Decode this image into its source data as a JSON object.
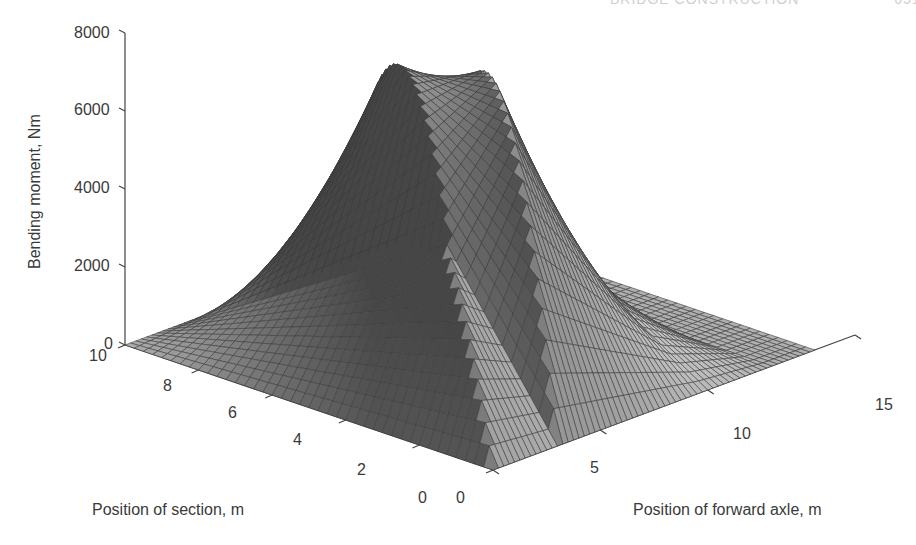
{
  "page": {
    "running_head": "BRIDGE CONSTRUCTION",
    "page_number": "651"
  },
  "chart_data": {
    "type": "surface3d",
    "title": "",
    "xlabel": "Position of forward axle, m",
    "ylabel": "Position of section, m",
    "zlabel": "Bending moment, Nm",
    "x_ticks": [
      "0",
      "5",
      "10",
      "15"
    ],
    "y_ticks": [
      "0",
      "2",
      "4",
      "6",
      "8",
      "10"
    ],
    "z_ticks": [
      "0",
      "2000",
      "4000",
      "6000",
      "8000"
    ],
    "x_range": [
      0,
      15
    ],
    "y_range": [
      0,
      10
    ],
    "z_range": [
      0,
      8000
    ],
    "grid": false,
    "colormap": "gray",
    "model": {
      "description": "Bending moment at a section of a 10 m simply supported span under a two-axle vehicle",
      "span_m": 10,
      "axle_spacing_m": 3,
      "forward_axle_load": 2000,
      "rear_axle_load": 2000
    },
    "key_points": [
      {
        "section": 5,
        "forward_axle": 6.5,
        "moment": 7000
      },
      {
        "section": 5,
        "forward_axle": 5,
        "moment": 5000
      },
      {
        "section": 5,
        "forward_axle": 8,
        "moment": 5000
      },
      {
        "section": 0,
        "forward_axle": 0,
        "moment": 0
      },
      {
        "section": 10,
        "forward_axle": 0,
        "moment": 0
      },
      {
        "section": 0,
        "forward_axle": 15,
        "moment": 0
      },
      {
        "section": 10,
        "forward_axle": 15,
        "moment": 0
      }
    ],
    "mesh": {
      "section_steps": 40,
      "axle_steps": 60
    }
  },
  "labels": {
    "z_ticks": [
      {
        "text": "8000",
        "x": 74,
        "y": 25
      },
      {
        "text": "6000",
        "x": 74,
        "y": 102
      },
      {
        "text": "4000",
        "x": 74,
        "y": 180
      },
      {
        "text": "2000",
        "x": 74,
        "y": 258
      },
      {
        "text": "0",
        "x": 104,
        "y": 336
      }
    ],
    "y_ticks": [
      {
        "text": "10",
        "x": 89,
        "y": 348
      },
      {
        "text": "8",
        "x": 163,
        "y": 378
      },
      {
        "text": "6",
        "x": 228,
        "y": 405
      },
      {
        "text": "4",
        "x": 293,
        "y": 432
      },
      {
        "text": "2",
        "x": 357,
        "y": 462
      },
      {
        "text": "0",
        "x": 418,
        "y": 490
      }
    ],
    "x_ticks": [
      {
        "text": "0",
        "x": 456,
        "y": 490
      },
      {
        "text": "5",
        "x": 590,
        "y": 460
      },
      {
        "text": "10",
        "x": 733,
        "y": 426
      },
      {
        "text": "15",
        "x": 875,
        "y": 397
      }
    ],
    "zlabel_pos": {
      "x": 27,
      "y": 269
    },
    "ylabel_pos": {
      "x": 92,
      "y": 502
    },
    "xlabel_pos": {
      "x": 633,
      "y": 502
    }
  }
}
